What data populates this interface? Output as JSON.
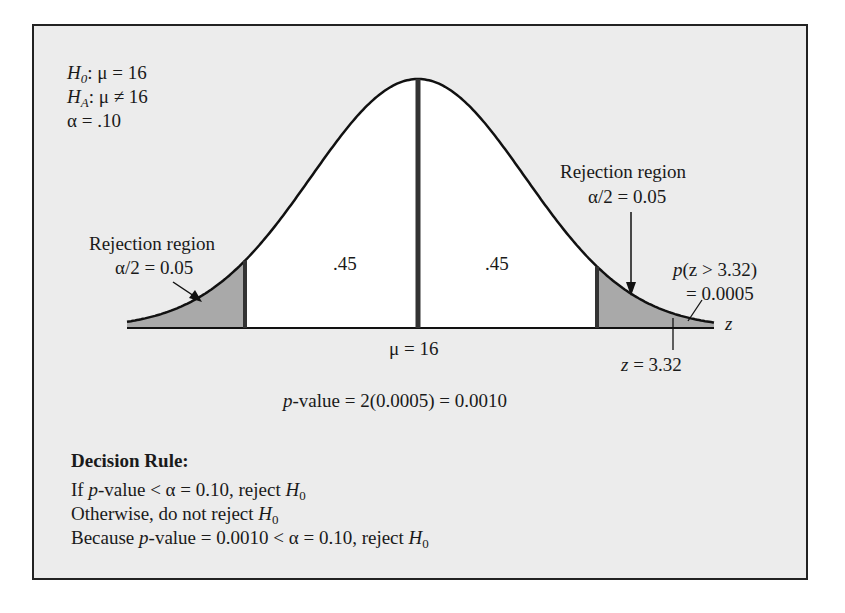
{
  "hypotheses": {
    "h0": {
      "sym": "H",
      "sub": "0",
      "rest": ": μ = 16"
    },
    "ha": {
      "sym": "H",
      "sub": "A",
      "rest": ": μ ≠ 16"
    },
    "alpha": "α = .10"
  },
  "left_region": {
    "title": "Rejection region",
    "value": "α/2 = 0.05"
  },
  "right_region": {
    "title": "Rejection region",
    "value": "α/2 = 0.05"
  },
  "center_areas": {
    "left": ".45",
    "right": ".45"
  },
  "mean_label": "μ = 16",
  "axis_label": "z",
  "tail_prob": {
    "line1_p": "p",
    "line1_rest": "(z > 3.32)",
    "line2": "= 0.0005"
  },
  "z_stat": {
    "z": "z",
    "rest": " = 3.32"
  },
  "p_value": {
    "p": "p",
    "rest": "-value = 2(0.0005) = 0.0010"
  },
  "decision": {
    "title": "Decision Rule:",
    "line1": {
      "pre": "If ",
      "p": "p",
      "mid": "-value < α = 0.10, reject ",
      "H": "H",
      "sub": "0"
    },
    "line2": {
      "pre": "Otherwise, do not reject ",
      "H": "H",
      "sub": "0"
    },
    "line3": {
      "pre": "Because ",
      "p": "p",
      "mid": "-value = 0.0010 < α = 0.10, reject ",
      "H": "H",
      "sub": "0"
    }
  },
  "colors": {
    "panel": "#ececec",
    "shade": "#a9a9a9",
    "line": "#111111"
  },
  "chart_data": {
    "type": "area",
    "distribution": "standard normal",
    "mean": 16,
    "alpha": 0.1,
    "critical_z": [
      -1.645,
      1.645
    ],
    "test_statistic_z": 3.32,
    "regions": [
      {
        "name": "left rejection region",
        "area": 0.05
      },
      {
        "name": "left acceptance",
        "area": 0.45
      },
      {
        "name": "right acceptance",
        "area": 0.45
      },
      {
        "name": "right rejection region",
        "area": 0.05
      }
    ],
    "tail_probability": 0.0005,
    "p_value": 0.001,
    "xlabel": "z"
  }
}
